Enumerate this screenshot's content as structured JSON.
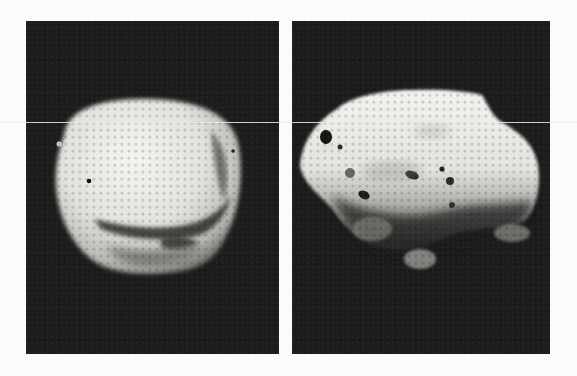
{
  "figure": {
    "panels": [
      {
        "id": "left",
        "subject": "Deimos-like moon, rounded body with dark equatorial groove",
        "background_color": "#1c1c1c",
        "body_color": "#e8e8e4"
      },
      {
        "id": "right",
        "subject": "Phobos-like moon, irregular cratered body",
        "background_color": "#1c1c1c",
        "body_color": "#e6e6e2"
      }
    ],
    "page_color": "#fbfbfa",
    "artifacts": [
      "horizontal scan line"
    ]
  }
}
